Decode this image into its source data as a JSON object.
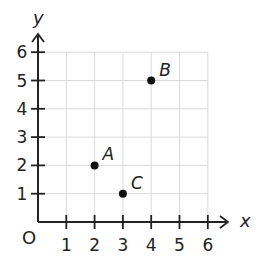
{
  "chart_data": {
    "type": "scatter",
    "title": "",
    "xlabel": "x",
    "ylabel": "y",
    "origin_label": "O",
    "xlim": [
      0,
      6
    ],
    "ylim": [
      0,
      6
    ],
    "grid": true,
    "x_ticks": [
      "1",
      "2",
      "3",
      "4",
      "5",
      "6"
    ],
    "y_ticks": [
      "1",
      "2",
      "3",
      "4",
      "5",
      "6"
    ],
    "points": [
      {
        "label": "A",
        "x": 2,
        "y": 2
      },
      {
        "label": "B",
        "x": 4,
        "y": 5
      },
      {
        "label": "C",
        "x": 3,
        "y": 1
      }
    ]
  },
  "colors": {
    "axis": "#222222",
    "grid": "#d9d9d9",
    "point": "#111111"
  }
}
